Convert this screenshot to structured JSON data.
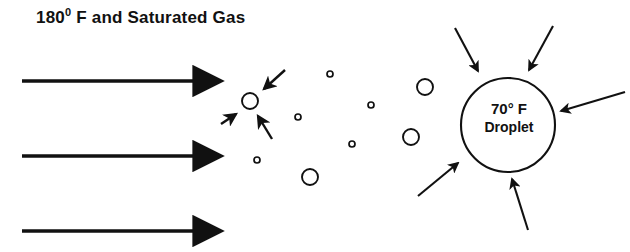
{
  "diagram": {
    "type": "droplet-heat-transfer-schematic",
    "background_color": "#ffffff",
    "ink_color": "#111111",
    "width": 630,
    "height": 252,
    "title": {
      "prefix": "180",
      "superscript": "0",
      "suffix": " F and Saturated Gas",
      "full_text": "180⁰ F and Saturated Gas"
    },
    "droplet": {
      "label_line1": "70° F",
      "label_line2": "Droplet",
      "center_x": 508,
      "center_y": 125,
      "radius": 47
    },
    "flow_arrows": {
      "name": "gas-flow-arrows",
      "count": 3,
      "direction": "left-to-right",
      "items": [
        {
          "x1": 22,
          "y1": 81,
          "x2": 205,
          "y2": 81
        },
        {
          "x1": 22,
          "y1": 156,
          "x2": 205,
          "y2": 156
        },
        {
          "x1": 22,
          "y1": 231,
          "x2": 205,
          "y2": 231
        }
      ]
    },
    "small_droplet_arrows": {
      "name": "small-droplet-heat-arrows",
      "count": 3,
      "direction": "converging-inward",
      "items": [
        {
          "x1": 285,
          "y1": 70,
          "x2": 262,
          "y2": 91
        },
        {
          "x1": 221,
          "y1": 124,
          "x2": 238,
          "y2": 113
        },
        {
          "x1": 272,
          "y1": 137,
          "x2": 257,
          "y2": 114
        }
      ]
    },
    "droplet_arrows": {
      "name": "droplet-heat-transfer-arrows",
      "count": 5,
      "direction": "converging-inward",
      "items": [
        {
          "x1": 455,
          "y1": 28,
          "x2": 480,
          "y2": 73
        },
        {
          "x1": 553,
          "y1": 26,
          "x2": 527,
          "y2": 72
        },
        {
          "x1": 625,
          "y1": 92,
          "x2": 564,
          "y2": 112
        },
        {
          "x1": 418,
          "y1": 196,
          "x2": 460,
          "y2": 162
        },
        {
          "x1": 528,
          "y1": 228,
          "x2": 512,
          "y2": 177
        }
      ]
    },
    "droplet_field": {
      "name": "suspended-droplet-field",
      "medium_circles": [
        {
          "cx": 250,
          "cy": 101,
          "r": 8
        },
        {
          "cx": 425,
          "cy": 87,
          "r": 8
        },
        {
          "cx": 411,
          "cy": 137,
          "r": 8
        },
        {
          "cx": 310,
          "cy": 177,
          "r": 8
        }
      ],
      "small_dots": [
        {
          "cx": 330,
          "cy": 74,
          "r": 3
        },
        {
          "cx": 298,
          "cy": 117,
          "r": 3
        },
        {
          "cx": 371,
          "cy": 105,
          "r": 3
        },
        {
          "cx": 352,
          "cy": 144,
          "r": 3
        },
        {
          "cx": 257,
          "cy": 160,
          "r": 3
        }
      ]
    }
  }
}
